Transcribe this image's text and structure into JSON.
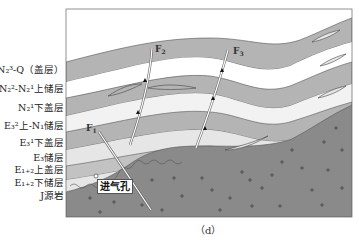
{
  "figure": {
    "caption": "（d）",
    "vent_label": "进气孔",
    "colors": {
      "cap_layer": "#b4b4b4",
      "reservoir_layer": "#ffffff",
      "light_reservoir": "#e6e6e6",
      "source_rock": "#8a8a8a",
      "outline": "#555555"
    },
    "faults": [
      {
        "id": "F1",
        "label": "F",
        "sub": "1"
      },
      {
        "id": "F2",
        "label": "F",
        "sub": "2"
      },
      {
        "id": "F3",
        "label": "F",
        "sub": "3"
      }
    ],
    "legend": [
      {
        "label": "N₂³-Q（盖层）"
      },
      {
        "label": "N₂²-N₂¹上储层"
      },
      {
        "label": "N₂¹下盖层"
      },
      {
        "label": "E₃²上-N₁储层"
      },
      {
        "label": "E₃¹下盖层"
      },
      {
        "label": "E₃储层"
      },
      {
        "label": "E₁₊₂上盖层"
      },
      {
        "label": "E₁₊₂下储层"
      },
      {
        "label": "J源岩"
      }
    ]
  }
}
